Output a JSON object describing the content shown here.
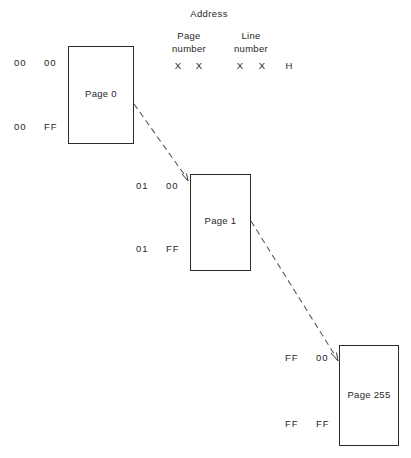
{
  "diagram": {
    "header": {
      "address_label": "Address",
      "columns": [
        {
          "line1": "Page",
          "line2": "number"
        },
        {
          "line1": "Line",
          "line2": "number"
        }
      ],
      "format_marks": [
        "X",
        "X",
        "X",
        "X"
      ],
      "radix_suffix": "H"
    },
    "pages": [
      {
        "name": "Page 0",
        "top_page_number": "00",
        "top_line_number": "00",
        "bottom_page_number": "00",
        "bottom_line_number": "FF"
      },
      {
        "name": "Page 1",
        "top_page_number": "01",
        "top_line_number": "00",
        "bottom_page_number": "01",
        "bottom_line_number": "FF"
      },
      {
        "name": "Page 255",
        "top_page_number": "FF",
        "top_line_number": "00",
        "bottom_page_number": "FF",
        "bottom_line_number": "FF"
      }
    ],
    "connectors": [
      {
        "from": "Page 0",
        "to": "Page 1",
        "style": "dashed-arrow"
      },
      {
        "from": "Page 1",
        "to": "Page 255",
        "style": "dashed-arrow"
      }
    ],
    "colors": {
      "stroke": "#2b2b2b",
      "text": "#262626",
      "background": "#ffffff"
    }
  }
}
